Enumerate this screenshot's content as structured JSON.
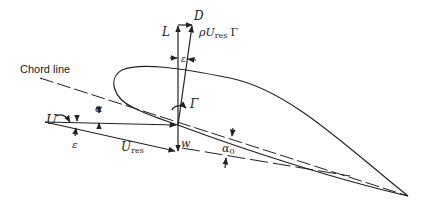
{
  "diagram": {
    "labels": {
      "chord_line": "Chord line",
      "lift": "L",
      "drag": "D",
      "resultant_force": "ρU",
      "resultant_force_sub": "res",
      "resultant_force_gamma": "Γ",
      "epsilon_top": "ε",
      "circulation": "Γ",
      "freestream": "U",
      "alpha": "α",
      "epsilon_left": "ε",
      "resultant_velocity": "U",
      "resultant_velocity_sub": "res",
      "downwash": "w",
      "alpha_zero": "α",
      "alpha_zero_sub": "0"
    },
    "colors": {
      "ink": "#222222",
      "background": "#ffffff"
    }
  }
}
